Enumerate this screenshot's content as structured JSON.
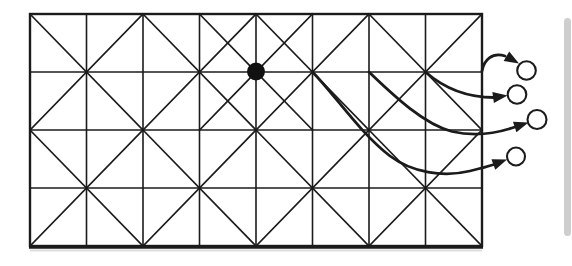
{
  "figure": {
    "width": 572,
    "height": 266,
    "background_color": "#ffffff",
    "ink_color": "#1b1b1b",
    "artifact_color": "#c9c9c9",
    "grid": {
      "x0": 30,
      "y0": 14,
      "cols": 8,
      "rows": 4,
      "col_width": 56.5,
      "row_height": 58,
      "mesh_line_width": 1.6,
      "border_width": 2.4,
      "bottom_edge_extra_width": 3
    },
    "macro_blocks": {
      "cols": 4,
      "rows": 2,
      "cells_per_block": 2,
      "pattern": "full-X-diagonals-per-2x2-block"
    },
    "refinement_star_segments": [
      {
        "from_col": 3,
        "from_row": 0,
        "to_col": 4,
        "to_row": 1
      },
      {
        "from_col": 5,
        "from_row": 0,
        "to_col": 4,
        "to_row": 1
      },
      {
        "from_col": 3,
        "from_row": 2,
        "to_col": 4,
        "to_row": 1
      },
      {
        "from_col": 5,
        "from_row": 2,
        "to_col": 4,
        "to_row": 1
      }
    ],
    "marked_vertex": {
      "col": 4,
      "row": 1,
      "radius": 9,
      "fill": "#111111"
    },
    "arrow_style": {
      "stroke_width": 2.8,
      "head_length": 14.5,
      "head_half_width": 5.6
    },
    "node_circle_style": {
      "stroke_width": 2.1,
      "fill": "#ffffff"
    },
    "arrows": [
      {
        "from_col": 8,
        "from_row": 1,
        "path": "M 482 71 C 484 60 492 52 505 56",
        "tip": [
          519,
          63.5
        ],
        "tip_angle": 30,
        "target_circle": {
          "cx": 526.5,
          "cy": 70.5,
          "r": 9.3
        }
      },
      {
        "from_col": 7,
        "from_row": 1,
        "path": "M 425.5 72 C 445 89 467 97.5 494 97.5",
        "tip": [
          507.5,
          95.5
        ],
        "tip_angle": -8,
        "target_circle": {
          "cx": 517,
          "cy": 94.5,
          "r": 9.3
        }
      },
      {
        "from_col": 6,
        "from_row": 1,
        "path": "M 369 72 C 395 97 424 124 452 131.5 C 472 136 495 134 515 127",
        "tip": [
          528.5,
          122.5
        ],
        "tip_angle": -18,
        "target_circle": {
          "cx": 537,
          "cy": 119.5,
          "r": 9.5
        }
      },
      {
        "from_col": 5,
        "from_row": 1,
        "path": "M 312.5 72 C 335 95 360 133 390 156 C 412 172.5 443 177.5 470 171 C 479 168.8 487 166.8 494 164.5",
        "tip": [
          507,
          159.5
        ],
        "tip_angle": -20,
        "target_circle": {
          "cx": 516,
          "cy": 156.5,
          "r": 9
        }
      }
    ],
    "page_edge_strip": {
      "x": 564,
      "y": 18,
      "width": 7,
      "height": 218,
      "rx": 3.5,
      "opacity": 0.9
    },
    "bottom_scan_smear": {
      "x": 30,
      "y": 249.5,
      "width": 452,
      "height": 2,
      "opacity": 0.65
    }
  }
}
